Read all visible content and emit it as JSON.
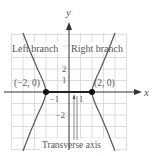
{
  "diagram": {
    "type": "hyperbola",
    "axes": {
      "x_label": "x",
      "y_label": "y"
    },
    "region_labels": {
      "left": "Left branch",
      "right": "Right branch"
    },
    "vertices": [
      {
        "label": "(−2, 0)",
        "x": -2,
        "y": 0
      },
      {
        "label": "(2, 0)",
        "x": 2,
        "y": 0
      }
    ],
    "ticks": {
      "x": [
        {
          "value": -1,
          "label": "−1"
        },
        {
          "value": 1,
          "label": "1"
        }
      ],
      "y": [
        {
          "value": 2,
          "label": "2"
        },
        {
          "value": 1,
          "label": "1"
        },
        {
          "value": -2,
          "label": "−2"
        }
      ]
    },
    "annotation": "Transverse axis",
    "colors": {
      "grid": "#d4d4d4",
      "axis": "#333333",
      "curve": "#555555",
      "point": "#111111",
      "text": "#555555"
    }
  }
}
